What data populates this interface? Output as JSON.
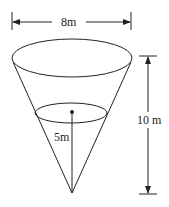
{
  "diagram": {
    "type": "inverted-cone",
    "labels": {
      "top_diameter": "8m",
      "height": "10 m",
      "water_depth": "5m"
    },
    "colors": {
      "stroke": "#222222",
      "background": "#ffffff"
    }
  }
}
